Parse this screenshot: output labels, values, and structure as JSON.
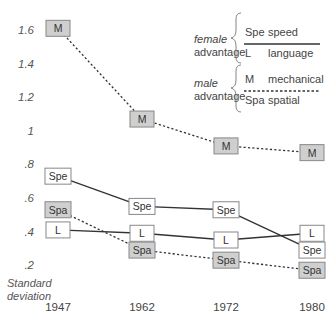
{
  "chart_data": {
    "type": "line",
    "title": "",
    "xlabel": "",
    "ylabel": "Standard deviation",
    "x": [
      "1947",
      "1962",
      "1972",
      "1980"
    ],
    "yticks": [
      "1.6",
      "1.4",
      "1.2",
      "1",
      ".8",
      ".6",
      ".4",
      ".2"
    ],
    "ylim": [
      0.2,
      1.6
    ],
    "grid": false,
    "legend_position": "upper right",
    "series": [
      {
        "code": "M",
        "name": "mechanical",
        "group": "male advantage",
        "line": "dotted",
        "fill": "#cfcfcf",
        "values": [
          1.61,
          1.07,
          0.91,
          0.87
        ]
      },
      {
        "code": "Spe",
        "name": "speed",
        "group": "female advantage",
        "line": "solid",
        "fill": "#ffffff",
        "values": [
          0.73,
          0.55,
          0.53,
          0.29
        ]
      },
      {
        "code": "Spa",
        "name": "spatial",
        "group": "male advantage",
        "line": "dotted",
        "fill": "#cfcfcf",
        "values": [
          0.53,
          0.29,
          0.23,
          0.17
        ]
      },
      {
        "code": "L",
        "name": "language",
        "group": "female advantage",
        "line": "solid",
        "fill": "#ffffff",
        "values": [
          0.41,
          0.39,
          0.35,
          0.39
        ]
      }
    ]
  },
  "legend": {
    "female_group": {
      "line1": "female",
      "line2": "advantage"
    },
    "male_group": {
      "line1": "male",
      "line2": "advantage"
    },
    "entries": [
      {
        "code": "Spe",
        "label": "speed"
      },
      {
        "code": "L",
        "label": "language"
      },
      {
        "code": "M",
        "label": "mechanical"
      },
      {
        "code": "Spa",
        "label": "spatial"
      }
    ]
  },
  "axis": {
    "ylabel_line1": "Standard",
    "ylabel_line2": "deviation"
  },
  "colors": {
    "line": "#333333",
    "box_border": "#888888",
    "male_fill": "#cfcfcf",
    "female_fill": "#ffffff"
  }
}
